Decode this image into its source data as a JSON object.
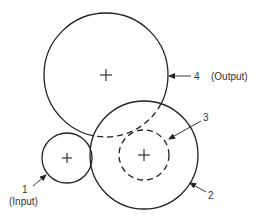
{
  "figure": {
    "type": "gear-train-diagram",
    "gears": [
      {
        "id": "1",
        "label": "1",
        "role": "(Input)",
        "style": "solid"
      },
      {
        "id": "2",
        "label": "2",
        "role": "",
        "style": "solid"
      },
      {
        "id": "3",
        "label": "3",
        "role": "",
        "style": "dashed"
      },
      {
        "id": "4",
        "label": "4",
        "role": "(Output)",
        "style": "solid-with-hidden-dashed"
      }
    ]
  },
  "labels": {
    "gear1_number": "1",
    "gear1_role": "(Input)",
    "gear2_number": "2",
    "gear3_number": "3",
    "gear4_number": "4",
    "gear4_role": "(Output)"
  },
  "colors": {
    "line": "#222222",
    "text": "#333333",
    "background": "#ffffff"
  }
}
